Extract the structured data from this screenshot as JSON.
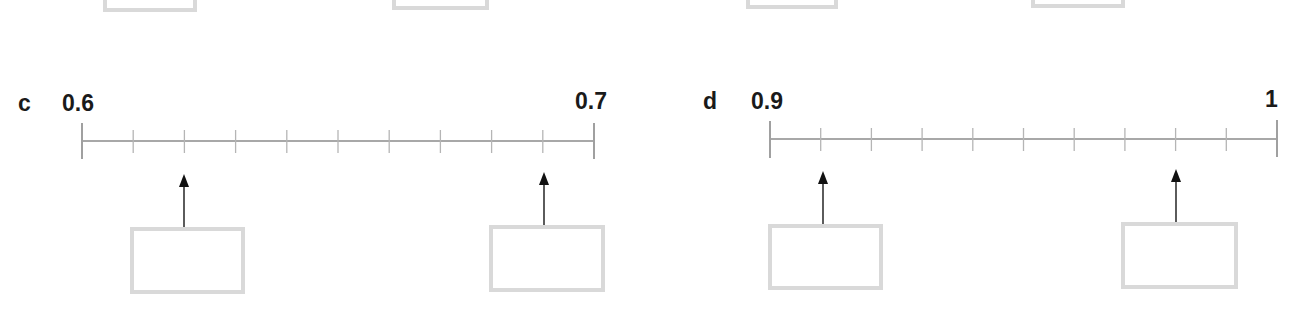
{
  "colors": {
    "text": "#1a1a1a",
    "line": "#a8a8a8",
    "tick": "#b0b0b0",
    "box_border": "#d9d9d9",
    "arrow": "#111111"
  },
  "top_partial_boxes": [
    {
      "x": 103,
      "w": 94,
      "bottom": 12
    },
    {
      "x": 392,
      "w": 97,
      "bottom": 10
    },
    {
      "x": 746,
      "w": 92,
      "bottom": 9
    },
    {
      "x": 1031,
      "w": 94,
      "bottom": 8
    }
  ],
  "number_lines": [
    {
      "id": "c",
      "part_label": "c",
      "start_label": "0.6",
      "end_label": "0.7",
      "start_value": 0.6,
      "end_value": 0.7,
      "divisions": 10,
      "x1": 82,
      "x2": 594,
      "y": 141,
      "arrows": [
        {
          "tick_index": 2,
          "value": "0.62",
          "answer": ""
        },
        {
          "tick_index": 9,
          "value": "0.69",
          "answer": ""
        }
      ]
    },
    {
      "id": "d",
      "part_label": "d",
      "start_label": "0.9",
      "end_label": "1",
      "start_value": 0.9,
      "end_value": 1.0,
      "divisions": 10,
      "x1": 770,
      "x2": 1277,
      "y": 139,
      "arrows": [
        {
          "tick_index": 1,
          "value": "0.91",
          "answer": ""
        },
        {
          "tick_index": 8,
          "value": "0.98",
          "answer": ""
        }
      ]
    }
  ],
  "answer_boxes": [
    {
      "line": "c",
      "x": 130,
      "y": 227,
      "w": 115,
      "h": 67,
      "arrow_x": 184,
      "arrow_tip": 175
    },
    {
      "line": "c",
      "x": 489,
      "y": 225,
      "w": 116,
      "h": 67,
      "arrow_x": 544,
      "arrow_tip": 173
    },
    {
      "line": "d",
      "x": 768,
      "y": 224,
      "w": 115,
      "h": 66,
      "arrow_x": 823,
      "arrow_tip": 172
    },
    {
      "line": "d",
      "x": 1121,
      "y": 222,
      "w": 117,
      "h": 67,
      "arrow_x": 1176,
      "arrow_tip": 170
    }
  ]
}
